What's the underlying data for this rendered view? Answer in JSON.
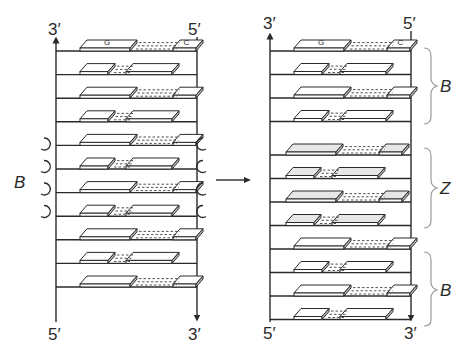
{
  "figure": {
    "left_helix": {
      "top_left_label": "3′",
      "top_right_label": "5′",
      "bottom_left_label": "5′",
      "bottom_right_label": "3′",
      "side_label": "B",
      "first_pair": {
        "left_base": "G",
        "right_base": "C"
      },
      "rows": 11,
      "rotation_arrows": 4
    },
    "transition_arrow": "→",
    "right_helix": {
      "top_left_label": "3′",
      "top_right_label": "5′",
      "bottom_left_label": "5′",
      "bottom_right_label": "3′",
      "first_pair": {
        "left_base": "G",
        "right_base": "C"
      },
      "segments": [
        {
          "label": "B",
          "rows": 4
        },
        {
          "label": "Z",
          "rows": 4
        },
        {
          "label": "B",
          "rows": 4
        }
      ]
    },
    "caption_fragment": "..."
  },
  "colors": {
    "ink": "#2a2a2a",
    "block_fill": "#ffffff",
    "block_side": "#bdbdbd",
    "z_block_fill": "#e6e6e6"
  }
}
